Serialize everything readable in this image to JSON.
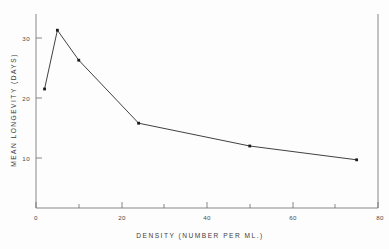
{
  "chart_data": {
    "type": "line",
    "title": "",
    "subtitle": "",
    "xlabel": "DENSITY  (NUMBER  PER  ML.)",
    "ylabel": "MEAN  LONGEVITY  (DAYS)",
    "xlim": [
      0,
      80
    ],
    "ylim": [
      0,
      34
    ],
    "xticks": [
      0,
      20,
      40,
      60,
      80
    ],
    "xtick_labels": [
      "0",
      "20",
      "40",
      "60",
      "80"
    ],
    "xminorticks": [
      10,
      30,
      50,
      70
    ],
    "yticks": [
      10,
      20,
      30
    ],
    "ytick_labels": [
      "10",
      "20",
      "30"
    ],
    "grid": false,
    "legend": null,
    "marker": "square",
    "series": [
      {
        "name": "mean longevity vs density",
        "x": [
          2,
          5,
          10,
          24,
          50,
          75
        ],
        "y": [
          21.5,
          31.3,
          26.3,
          15.8,
          12.0,
          9.7
        ]
      }
    ],
    "points": [
      {
        "x": 2,
        "y": 21.5
      },
      {
        "x": 5,
        "y": 31.3
      },
      {
        "x": 10,
        "y": 26.3
      },
      {
        "x": 24,
        "y": 15.8
      },
      {
        "x": 50,
        "y": 12.0
      },
      {
        "x": 75,
        "y": 9.7
      }
    ],
    "colors": {
      "line": "#2b2b2b",
      "marker": "#1a1a1a",
      "axis": "#6b6b6b",
      "text": "#3c3c3c",
      "background": "#fdfdfd"
    }
  },
  "axes": {
    "x_title": "DENSITY  (NUMBER  PER  ML.)",
    "y_title": "MEAN  LONGEVITY  (DAYS)",
    "x_tick_0": "0",
    "x_tick_1": "20",
    "x_tick_2": "40",
    "x_tick_3": "60",
    "x_tick_4": "80",
    "y_tick_0": "10",
    "y_tick_1": "20",
    "y_tick_2": "30"
  }
}
